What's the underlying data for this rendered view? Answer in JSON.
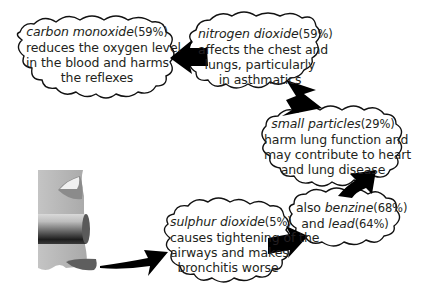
{
  "diagram": {
    "type": "flow",
    "source": {
      "label": "exhaust-pipe",
      "icon": "exhaust-pipe-icon"
    },
    "colors": {
      "outline": "#111111",
      "text": "#231f20",
      "arrow": "#000000",
      "pipe_light": "#c8c8c8",
      "pipe_mid": "#9a9a9a",
      "pipe_dark": "#2a2a2a",
      "background": "#ffffff"
    },
    "clouds": [
      {
        "id": "sulphur-dioxide",
        "pollutant": "sulphur dioxide",
        "percent": "(5%)",
        "lines": [
          "causes tightening of the",
          "airways and makes",
          "bronchitis worse"
        ]
      },
      {
        "id": "benzine-lead",
        "prefix": "also",
        "pollutant": "benzine",
        "percent": "(68%)",
        "connector": "and",
        "pollutant2": "lead",
        "percent2": "(64%)"
      },
      {
        "id": "small-particles",
        "pollutant": "small particles",
        "percent": "(29%)",
        "lines": [
          "harm lung function and",
          "may contribute to heart",
          "and lung disease"
        ]
      },
      {
        "id": "nitrogen-dioxide",
        "pollutant": "nitrogen dioxide",
        "percent": "(59%)",
        "lines": [
          "affects the chest and",
          "lungs, particularly",
          "in asthmatics"
        ]
      },
      {
        "id": "carbon-monoxide",
        "pollutant": "carbon monoxide",
        "percent": "(59%)",
        "lines": [
          "reduces the oxygen level",
          "in the blood and harms",
          "the reflexes"
        ]
      }
    ],
    "flow_order": [
      "exhaust-pipe",
      "sulphur-dioxide",
      "benzine-lead",
      "small-particles",
      "nitrogen-dioxide",
      "carbon-monoxide"
    ]
  }
}
